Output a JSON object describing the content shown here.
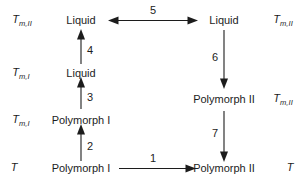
{
  "diagram": {
    "type": "thermodynamic-cycle",
    "title": "",
    "nodes": [
      {
        "id": "liquid-top-left",
        "label": "Liquid",
        "column": "left",
        "row": 1
      },
      {
        "id": "liquid-top-right",
        "label": "Liquid",
        "column": "right",
        "row": 1
      },
      {
        "id": "liquid-mid-left",
        "label": "Liquid",
        "column": "left",
        "row": 2
      },
      {
        "id": "polymorph-i-mid-left",
        "label": "Polymorph I",
        "column": "left",
        "row": 3
      },
      {
        "id": "polymorph-ii-mid-right",
        "label": "Polymorph II",
        "column": "right",
        "row": 3
      },
      {
        "id": "polymorph-i-bottom",
        "label": "Polymorph I",
        "column": "left",
        "row": 4
      },
      {
        "id": "polymorph-ii-bottom",
        "label": "Polymorph II",
        "column": "right",
        "row": 4
      }
    ],
    "temperature_labels": {
      "left": [
        {
          "id": "temp-left-row1",
          "base": "T",
          "sub": "m,II"
        },
        {
          "id": "temp-left-row2",
          "base": "T",
          "sub": "m,I"
        },
        {
          "id": "temp-left-row3",
          "base": "T",
          "sub": "m,I"
        },
        {
          "id": "temp-left-row4",
          "base": "T",
          "sub": ""
        }
      ],
      "right": [
        {
          "id": "temp-right-row1",
          "base": "T",
          "sub": "m,II"
        },
        {
          "id": "temp-right-row3",
          "base": "T",
          "sub": "m,II"
        },
        {
          "id": "temp-right-row4",
          "base": "T",
          "sub": ""
        }
      ]
    },
    "arrows": [
      {
        "id": "arrow-1",
        "label": "1",
        "direction": "right",
        "from": "polymorph-i-bottom",
        "to": "polymorph-ii-bottom"
      },
      {
        "id": "arrow-2",
        "label": "2",
        "direction": "up",
        "from": "polymorph-i-bottom",
        "to": "polymorph-i-mid-left"
      },
      {
        "id": "arrow-3",
        "label": "3",
        "direction": "up",
        "from": "polymorph-i-mid-left",
        "to": "liquid-mid-left"
      },
      {
        "id": "arrow-4",
        "label": "4",
        "direction": "up",
        "from": "liquid-mid-left",
        "to": "liquid-top-left"
      },
      {
        "id": "arrow-5",
        "label": "5",
        "direction": "bidirectional",
        "from": "liquid-top-left",
        "to": "liquid-top-right"
      },
      {
        "id": "arrow-6",
        "label": "6",
        "direction": "down",
        "from": "liquid-top-right",
        "to": "polymorph-ii-mid-right"
      },
      {
        "id": "arrow-7",
        "label": "7",
        "direction": "down",
        "from": "polymorph-ii-mid-right",
        "to": "polymorph-ii-bottom"
      }
    ],
    "colors": {
      "background": "#ffffff",
      "ink": "#1c1c1c"
    }
  }
}
